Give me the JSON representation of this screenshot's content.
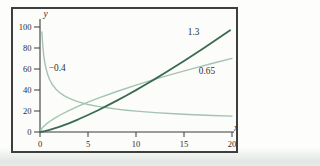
{
  "figure": {
    "page_background": "#fdfdfc",
    "page_shade_bottom": "#e6eae6",
    "frame_border_color": "#3c403c",
    "plot_background": "#fcfcfa",
    "axis_color": "#3a3a3a",
    "text_color": "#2e2e2e"
  },
  "chart_data": {
    "type": "line",
    "title": "",
    "xlabel": "x",
    "ylabel": "y",
    "xlim": [
      0,
      20
    ],
    "ylim": [
      0,
      100
    ],
    "xticks": [
      0,
      5,
      10,
      15,
      20
    ],
    "yticks": [
      0,
      20,
      40,
      60,
      80,
      100
    ],
    "grid": false,
    "legend_position": "inline-labels",
    "series": [
      {
        "name": "power-0.65",
        "label": "0.65",
        "exponent": 0.65,
        "color": "#a4c3b2",
        "width": 1.4,
        "label_pos": [
          17.4,
          58
        ],
        "points": [
          [
            0,
            0
          ],
          [
            0.1,
            2.2
          ],
          [
            0.3,
            4.6
          ],
          [
            0.6,
            7.2
          ],
          [
            1,
            10
          ],
          [
            1.5,
            13
          ],
          [
            2,
            15.7
          ],
          [
            3,
            20.4
          ],
          [
            4,
            24.6
          ],
          [
            5,
            28.5
          ],
          [
            6,
            32.1
          ],
          [
            8,
            38.6
          ],
          [
            10,
            44.7
          ],
          [
            12,
            50.3
          ],
          [
            14,
            55.6
          ],
          [
            16,
            60.6
          ],
          [
            18,
            65.5
          ],
          [
            20,
            70.1
          ]
        ]
      },
      {
        "name": "power-neg-0.4",
        "label": "−0.4",
        "exponent": -0.4,
        "color": "#a4c3b2",
        "width": 1.4,
        "label_pos": [
          1.8,
          61
        ],
        "points": [
          [
            0.2,
            95.2
          ],
          [
            0.25,
            87.1
          ],
          [
            0.3,
            81
          ],
          [
            0.35,
            76.1
          ],
          [
            0.4,
            72.3
          ],
          [
            0.5,
            66
          ],
          [
            0.6,
            61.3
          ],
          [
            0.8,
            54.7
          ],
          [
            1,
            50
          ],
          [
            1.3,
            45
          ],
          [
            1.7,
            40.4
          ],
          [
            2,
            37.9
          ],
          [
            2.5,
            34.7
          ],
          [
            3,
            32.2
          ],
          [
            3.5,
            30.3
          ],
          [
            4,
            28.7
          ],
          [
            5,
            26.2
          ],
          [
            6,
            24.4
          ],
          [
            7,
            23
          ],
          [
            8,
            21.8
          ],
          [
            9,
            20.8
          ],
          [
            10,
            19.9
          ],
          [
            12,
            18.5
          ],
          [
            14,
            17.4
          ],
          [
            16,
            16.5
          ],
          [
            18,
            15.7
          ],
          [
            20,
            15.1
          ]
        ]
      },
      {
        "name": "power-1.3",
        "label": "1.3",
        "exponent": 1.3,
        "color": "#3a6b52",
        "width": 1.8,
        "label_pos": [
          16,
          95.5
        ],
        "points": [
          [
            0,
            0
          ],
          [
            0.5,
            0.8
          ],
          [
            1,
            2
          ],
          [
            1.5,
            3.4
          ],
          [
            2,
            4.9
          ],
          [
            3,
            8.3
          ],
          [
            4,
            12.1
          ],
          [
            5,
            16.2
          ],
          [
            6,
            20.5
          ],
          [
            7,
            25.1
          ],
          [
            8,
            29.9
          ],
          [
            9,
            34.8
          ],
          [
            10,
            39.9
          ],
          [
            11,
            45.2
          ],
          [
            12,
            50.6
          ],
          [
            13,
            56.1
          ],
          [
            14,
            61.8
          ],
          [
            15,
            67.6
          ],
          [
            16,
            73.5
          ],
          [
            17,
            79.5
          ],
          [
            18,
            85.7
          ],
          [
            19,
            91.9
          ],
          [
            19.8,
            97
          ]
        ]
      }
    ]
  }
}
